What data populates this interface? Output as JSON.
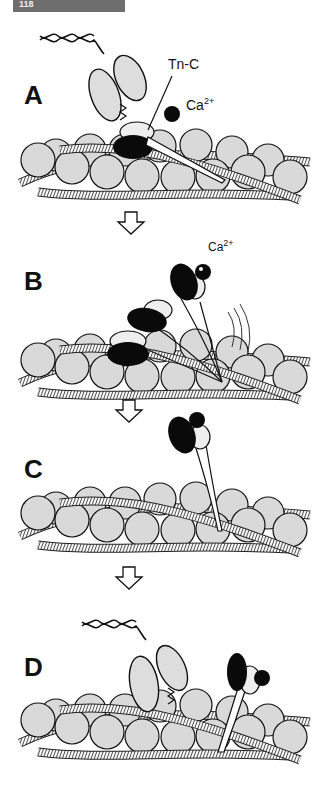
{
  "header": {
    "tab_label": "118"
  },
  "panels": [
    {
      "id": "A",
      "label": "A",
      "annotations": {
        "tnc": "Tn-C",
        "ca": "Ca",
        "ca_charge": "2+"
      }
    },
    {
      "id": "B",
      "label": "B",
      "annotations": {
        "ca": "Ca",
        "ca_charge": "2+"
      }
    },
    {
      "id": "C",
      "label": "C"
    },
    {
      "id": "D",
      "label": "D"
    }
  ],
  "arrows": [
    "A→B",
    "B→C",
    "C→D"
  ],
  "colors": {
    "actin_fill": "#d9d9d9",
    "outline": "#111111",
    "troponin_dark": "#0a0a0a",
    "tab_bg": "#6e6e6e"
  }
}
